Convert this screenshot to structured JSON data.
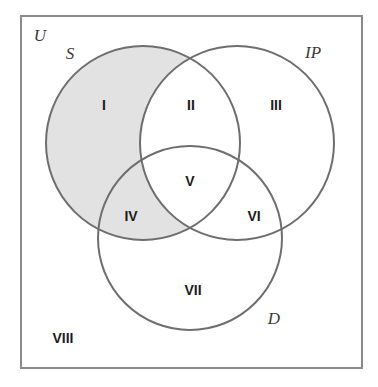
{
  "figure": {
    "type": "venn-diagram",
    "set_count": 3,
    "universe_label": "U",
    "background_color": "#ffffff",
    "frame": {
      "name": "universal-set-frame",
      "x": 21,
      "y": 16,
      "width": 341,
      "height": 352,
      "stroke_color": "#8a8a8a",
      "stroke_width": 2,
      "fill_color": "#ffffff"
    },
    "style": {
      "circle_stroke_color": "#6e6e6e",
      "circle_stroke_width": 2,
      "circle_fill_color": "none",
      "shade_fill_color": "#e2e2e2",
      "region_label_color": "#1c1c1c",
      "set_label_color": "#3b3b3b"
    },
    "circles": [
      {
        "id": "S",
        "label": "S",
        "cx": 143,
        "cy": 143,
        "r": 97,
        "label_x": 70,
        "label_y": 55
      },
      {
        "id": "IP",
        "label": "IP",
        "cx": 237,
        "cy": 143,
        "r": 97,
        "label_x": 313,
        "label_y": 54
      },
      {
        "id": "D",
        "label": "D",
        "cx": 190,
        "cy": 238,
        "r": 92,
        "label_x": 274,
        "label_y": 320
      }
    ],
    "shaded": {
      "description": "S excluding IP",
      "sets_included": [
        "S"
      ],
      "sets_excluded": [
        "IP"
      ],
      "regions": [
        "I",
        "IV"
      ],
      "color": "#e2e2e2"
    },
    "regions": [
      {
        "id": "I",
        "label": "I",
        "x": 104,
        "y": 106,
        "shaded": true,
        "membership": [
          "S"
        ]
      },
      {
        "id": "II",
        "label": "II",
        "x": 191,
        "y": 106,
        "shaded": false,
        "membership": [
          "S",
          "IP"
        ]
      },
      {
        "id": "III",
        "label": "III",
        "x": 276,
        "y": 106,
        "shaded": false,
        "membership": [
          "IP"
        ]
      },
      {
        "id": "IV",
        "label": "IV",
        "x": 131,
        "y": 217,
        "shaded": true,
        "membership": [
          "S",
          "D"
        ]
      },
      {
        "id": "V",
        "label": "V",
        "x": 190,
        "y": 182,
        "shaded": false,
        "membership": [
          "S",
          "IP",
          "D"
        ]
      },
      {
        "id": "VI",
        "label": "VI",
        "x": 254,
        "y": 217,
        "shaded": false,
        "membership": [
          "IP",
          "D"
        ]
      },
      {
        "id": "VII",
        "label": "VII",
        "x": 193,
        "y": 291,
        "shaded": false,
        "membership": [
          "D"
        ]
      },
      {
        "id": "VIII",
        "label": "VIII",
        "x": 63,
        "y": 339,
        "shaded": false,
        "membership": []
      }
    ],
    "universe_label_position": {
      "x": 40,
      "y": 37
    }
  }
}
